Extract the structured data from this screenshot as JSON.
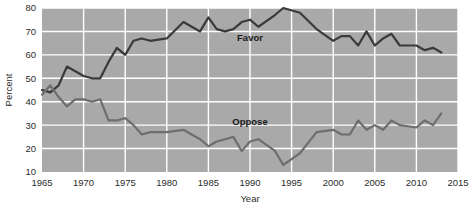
{
  "chart_data": {
    "type": "line",
    "title": "",
    "xlabel": "Year",
    "ylabel": "Percent",
    "xlim": [
      1965,
      2015
    ],
    "ylim": [
      10,
      80
    ],
    "xticks": [
      1965,
      1970,
      1975,
      1980,
      1985,
      1990,
      1995,
      2000,
      2005,
      2010,
      2015
    ],
    "yticks": [
      10,
      20,
      30,
      40,
      50,
      60,
      70,
      80
    ],
    "grid": true,
    "legend_position": "inline-annotations",
    "plot_background_color": "#a9a9a9",
    "grid_color": "#ffffff",
    "series": [
      {
        "name": "Favor",
        "color": "#3a3a3a",
        "label_x": 1990,
        "label_y": 66,
        "x": [
          1965,
          1966,
          1967,
          1968,
          1969,
          1970,
          1971,
          1972,
          1973,
          1974,
          1975,
          1976,
          1977,
          1978,
          1980,
          1982,
          1983,
          1984,
          1985,
          1986,
          1987,
          1988,
          1989,
          1990,
          1991,
          1993,
          1994,
          1996,
          1998,
          2000,
          2001,
          2002,
          2003,
          2004,
          2005,
          2006,
          2007,
          2008,
          2010,
          2011,
          2012,
          2013
        ],
        "values": [
          45,
          44,
          47,
          55,
          53,
          51,
          50,
          50,
          57,
          63,
          60,
          66,
          67,
          66,
          67,
          74,
          72,
          70,
          76,
          71,
          70,
          71,
          74,
          75,
          72,
          77,
          80,
          78,
          71,
          66,
          68,
          68,
          64,
          70,
          64,
          67,
          69,
          64,
          64,
          62,
          63,
          61
        ]
      },
      {
        "name": "Oppose",
        "color": "#6e6e6e",
        "label_x": 1990,
        "label_y": 30,
        "x": [
          1965,
          1966,
          1967,
          1968,
          1969,
          1970,
          1971,
          1972,
          1973,
          1974,
          1975,
          1976,
          1977,
          1978,
          1980,
          1982,
          1983,
          1984,
          1985,
          1986,
          1987,
          1988,
          1989,
          1990,
          1991,
          1993,
          1994,
          1996,
          1998,
          2000,
          2001,
          2002,
          2003,
          2004,
          2005,
          2006,
          2007,
          2008,
          2010,
          2011,
          2012,
          2013
        ],
        "values": [
          43,
          47,
          42,
          38,
          41,
          41,
          40,
          41,
          32,
          32,
          33,
          30,
          26,
          27,
          27,
          28,
          26,
          24,
          21,
          23,
          24,
          25,
          19,
          23,
          24,
          19,
          13,
          18,
          27,
          28,
          26,
          26,
          32,
          28,
          30,
          28,
          32,
          30,
          29,
          32,
          30,
          35
        ]
      }
    ]
  }
}
